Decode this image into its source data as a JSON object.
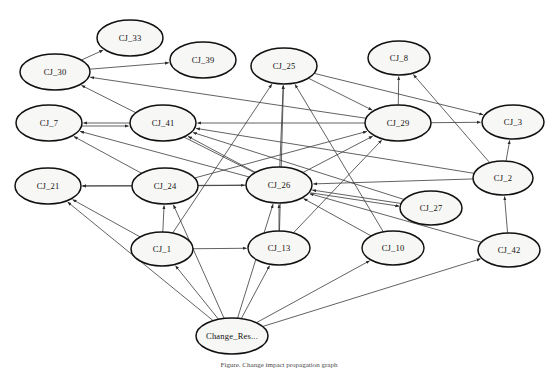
{
  "figure": {
    "caption": "Figure. Change impact propagation graph",
    "width": 558,
    "height": 371,
    "background_color": "#ffffff",
    "node_fill_color": "#f7f7f5",
    "node_stroke_color": "#111111",
    "edge_color": "#3a3a3a"
  },
  "chart_data": {
    "type": "diagram",
    "diagram_kind": "directed-graph",
    "node_count": 18,
    "edge_count": 45,
    "nodes": [
      {
        "id": "CJ_33",
        "label": "CJ_33",
        "cx": 130,
        "cy": 38,
        "rx": 33,
        "ry": 18
      },
      {
        "id": "CJ_39",
        "label": "CJ_39",
        "cx": 203,
        "cy": 60,
        "rx": 33,
        "ry": 18
      },
      {
        "id": "CJ_25",
        "label": "CJ_25",
        "cx": 284,
        "cy": 66,
        "rx": 33,
        "ry": 18
      },
      {
        "id": "CJ_8",
        "label": "CJ_8",
        "cx": 399,
        "cy": 58,
        "rx": 31,
        "ry": 17
      },
      {
        "id": "CJ_30",
        "label": "CJ_30",
        "cx": 55,
        "cy": 72,
        "rx": 35,
        "ry": 18
      },
      {
        "id": "CJ_7",
        "label": "CJ_7",
        "cx": 49,
        "cy": 123,
        "rx": 33,
        "ry": 18
      },
      {
        "id": "CJ_41",
        "label": "CJ_41",
        "cx": 163,
        "cy": 123,
        "rx": 33,
        "ry": 18
      },
      {
        "id": "CJ_29",
        "label": "CJ_29",
        "cx": 398,
        "cy": 123,
        "rx": 33,
        "ry": 18
      },
      {
        "id": "CJ_3",
        "label": "CJ_3",
        "cx": 513,
        "cy": 122,
        "rx": 31,
        "ry": 17
      },
      {
        "id": "CJ_21",
        "label": "CJ_21",
        "cx": 48,
        "cy": 186,
        "rx": 33,
        "ry": 18
      },
      {
        "id": "CJ_24",
        "label": "CJ_24",
        "cx": 165,
        "cy": 186,
        "rx": 33,
        "ry": 18
      },
      {
        "id": "CJ_26",
        "label": "CJ_26",
        "cx": 279,
        "cy": 185,
        "rx": 33,
        "ry": 18
      },
      {
        "id": "CJ_2",
        "label": "CJ_2",
        "cx": 503,
        "cy": 178,
        "rx": 30,
        "ry": 17
      },
      {
        "id": "CJ_27",
        "label": "CJ_27",
        "cx": 431,
        "cy": 208,
        "rx": 31,
        "ry": 17
      },
      {
        "id": "CJ_1",
        "label": "CJ_1",
        "cx": 162,
        "cy": 249,
        "rx": 31,
        "ry": 17
      },
      {
        "id": "CJ_13",
        "label": "CJ_13",
        "cx": 279,
        "cy": 248,
        "rx": 31,
        "ry": 17
      },
      {
        "id": "CJ_10",
        "label": "CJ_10",
        "cx": 393,
        "cy": 248,
        "rx": 31,
        "ry": 17
      },
      {
        "id": "CJ_42",
        "label": "CJ_42",
        "cx": 509,
        "cy": 250,
        "rx": 31,
        "ry": 17
      },
      {
        "id": "Change_Res",
        "label": "Change_Res...",
        "cx": 232,
        "cy": 336,
        "rx": 36,
        "ry": 18
      }
    ],
    "edges": [
      {
        "from": "CJ_30",
        "to": "CJ_33"
      },
      {
        "from": "CJ_30",
        "to": "CJ_39"
      },
      {
        "from": "CJ_29",
        "to": "CJ_30"
      },
      {
        "from": "CJ_26",
        "to": "CJ_30"
      },
      {
        "from": "CJ_41",
        "to": "CJ_7"
      },
      {
        "from": "CJ_7",
        "to": "CJ_41"
      },
      {
        "from": "CJ_24",
        "to": "CJ_7"
      },
      {
        "from": "CJ_26",
        "to": "CJ_7"
      },
      {
        "from": "CJ_29",
        "to": "CJ_41"
      },
      {
        "from": "CJ_26",
        "to": "CJ_41"
      },
      {
        "from": "CJ_2",
        "to": "CJ_41"
      },
      {
        "from": "CJ_27",
        "to": "CJ_41"
      },
      {
        "from": "CJ_26",
        "to": "CJ_25"
      },
      {
        "from": "CJ_1",
        "to": "CJ_25"
      },
      {
        "from": "CJ_13",
        "to": "CJ_25"
      },
      {
        "from": "CJ_10",
        "to": "CJ_25"
      },
      {
        "from": "CJ_29",
        "to": "CJ_8"
      },
      {
        "from": "CJ_2",
        "to": "CJ_8"
      },
      {
        "from": "CJ_25",
        "to": "CJ_29"
      },
      {
        "from": "CJ_26",
        "to": "CJ_29"
      },
      {
        "from": "CJ_24",
        "to": "CJ_29"
      },
      {
        "from": "CJ_13",
        "to": "CJ_29"
      },
      {
        "from": "CJ_25",
        "to": "CJ_3"
      },
      {
        "from": "CJ_29",
        "to": "CJ_3"
      },
      {
        "from": "CJ_2",
        "to": "CJ_3"
      },
      {
        "from": "CJ_24",
        "to": "CJ_21"
      },
      {
        "from": "CJ_26",
        "to": "CJ_21"
      },
      {
        "from": "CJ_1",
        "to": "CJ_21"
      },
      {
        "from": "Change_Res",
        "to": "CJ_21"
      },
      {
        "from": "CJ_24",
        "to": "CJ_26"
      },
      {
        "from": "CJ_1",
        "to": "CJ_24"
      },
      {
        "from": "Change_Res",
        "to": "CJ_24"
      },
      {
        "from": "CJ_13",
        "to": "CJ_26"
      },
      {
        "from": "CJ_10",
        "to": "CJ_26"
      },
      {
        "from": "CJ_27",
        "to": "CJ_26"
      },
      {
        "from": "CJ_2",
        "to": "CJ_26"
      },
      {
        "from": "CJ_42",
        "to": "CJ_26"
      },
      {
        "from": "Change_Res",
        "to": "CJ_26"
      },
      {
        "from": "CJ_26",
        "to": "CJ_27"
      },
      {
        "from": "CJ_42",
        "to": "CJ_2"
      },
      {
        "from": "CJ_1",
        "to": "CJ_13"
      },
      {
        "from": "Change_Res",
        "to": "CJ_1"
      },
      {
        "from": "Change_Res",
        "to": "CJ_13"
      },
      {
        "from": "Change_Res",
        "to": "CJ_10"
      },
      {
        "from": "Change_Res",
        "to": "CJ_42"
      }
    ]
  }
}
